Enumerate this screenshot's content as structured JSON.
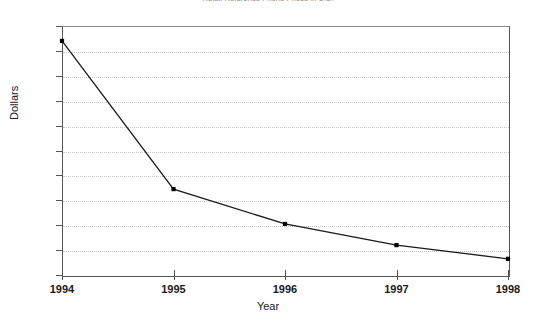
{
  "chart_data": {
    "type": "line",
    "title": "Retail Reference Phone Prices in U.S.",
    "xlabel": "Year",
    "ylabel": "Dollars",
    "categories": [
      "1994",
      "1995",
      "1996",
      "1997",
      "1998"
    ],
    "x": [
      1994,
      1995,
      1996,
      1997,
      1998
    ],
    "values": [
      94,
      34.5,
      20.5,
      12,
      6.5
    ],
    "series": [
      {
        "name": "Retail price",
        "values": [
          94,
          34.5,
          20.5,
          12,
          6.5
        ]
      }
    ],
    "ylim": [
      0,
      100
    ],
    "ytick_labels": [
      "0",
      "10",
      "20",
      "30",
      "40",
      "50",
      "60",
      "70",
      "80",
      "90",
      "100"
    ],
    "ytick_values": [
      0,
      10,
      20,
      30,
      40,
      50,
      60,
      70,
      80,
      90,
      100
    ],
    "xtick_labels": [
      "1994",
      "1995",
      "1996",
      "1997",
      "1998"
    ],
    "grid": true,
    "grid_axis": "y",
    "grid_style": "dotted",
    "legend": false,
    "legend_position": "none",
    "marker": "square",
    "line_color": "#1a1a1a",
    "grid_color": "#c9c9c9",
    "axis_color": "#555555",
    "background_color": "#ffffff"
  }
}
